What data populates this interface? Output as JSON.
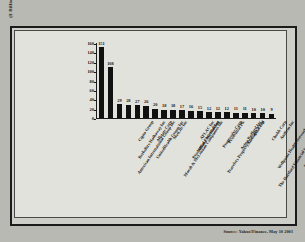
{
  "figure": {
    "source_note": "Source: Yahoo!Finance, May 10 2003",
    "background_color": "#b9b9b4",
    "bar_color": "#111111",
    "frame_color": "#1b1b1b"
  },
  "chart_data": {
    "type": "bar",
    "title": "",
    "subtitle": "",
    "xlabel": "",
    "ylabel": "($ Billions)",
    "ylim": [
      0,
      160
    ],
    "yticks": [
      0,
      20,
      40,
      60,
      80,
      100,
      120,
      140,
      160
    ],
    "ytick_labels": [
      "0",
      "20",
      "40",
      "60",
      "80",
      "100",
      "120",
      "140",
      "160"
    ],
    "grid": false,
    "legend": false,
    "data_labels": true,
    "categories": [
      "American International Group Inc",
      "Berkshire Hathaway Inc",
      "Cigna Group",
      "UnitedHealth Group Inc",
      "Allstate Corp",
      "Marsh & McLennan Companies Inc",
      "MetLife Inc",
      "Prudential Financial Inc",
      "Allianz AG Holding",
      "AFLAC Inc",
      "Travelers Property Casualty Corp",
      "Progressive Corp",
      "Prudential Plc",
      "Aetna Bedford Inc",
      "XL Capital Ltd",
      "The Hartford Financial Services Group Inc",
      "Wellpoint Health Networks Inc",
      "Chubb Corp",
      "Anthem Inc",
      "Principal Financial Group Inc"
    ],
    "values": [
      151,
      108,
      29,
      28,
      27,
      26,
      20,
      18,
      18,
      17,
      16,
      15,
      12,
      12,
      12,
      11,
      11,
      10,
      10,
      9
    ],
    "value_labels": [
      "151",
      "108",
      "29",
      "28",
      "27",
      "26",
      "20",
      "18",
      "18",
      "17",
      "16",
      "15",
      "12",
      "12",
      "12",
      "11",
      "11",
      "10",
      "10",
      "9"
    ]
  }
}
